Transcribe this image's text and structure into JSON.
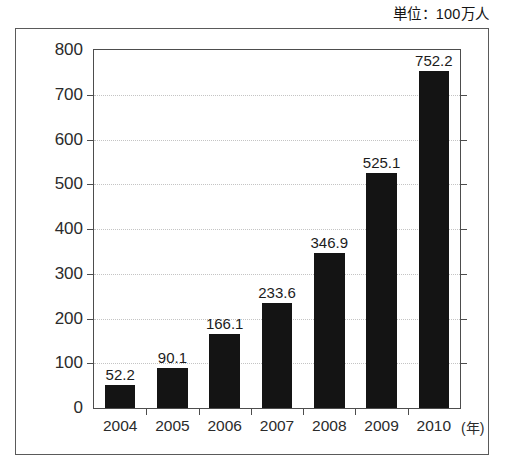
{
  "unit_caption": "単位：100万人",
  "axis": {
    "x_unit_suffix": "(年)",
    "y_ticks": [
      "800",
      "700",
      "600",
      "500",
      "400",
      "300",
      "200",
      "100",
      "0"
    ]
  },
  "chart_data": {
    "type": "bar",
    "title": "",
    "subtitle": "",
    "xlabel": "(年)",
    "ylabel": "単位：100万人",
    "categories": [
      "2004",
      "2005",
      "2006",
      "2007",
      "2008",
      "2009",
      "2010"
    ],
    "values": [
      52.2,
      90.1,
      166.1,
      233.6,
      346.9,
      525.1,
      752.2
    ],
    "value_labels": [
      "52.2",
      "90.1",
      "166.1",
      "233.6",
      "346.9",
      "525.1",
      "752.2"
    ],
    "ylim": [
      0,
      800
    ],
    "ytick_step": 100,
    "grid": true,
    "legend": false,
    "bar_color": "#141414",
    "gridline_color": "#c4c4c4",
    "axis_color": "#4d4d4d",
    "background_color": "#ffffff"
  }
}
